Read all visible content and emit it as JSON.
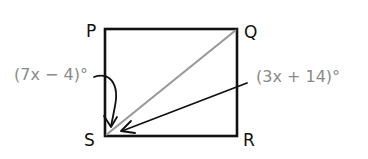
{
  "diagram": {
    "type": "geometry-square-with-diagonal",
    "vertices": {
      "P": {
        "label": "P",
        "x": 105,
        "y": 29
      },
      "Q": {
        "label": "Q",
        "x": 237,
        "y": 29
      },
      "R": {
        "label": "R",
        "x": 237,
        "y": 136
      },
      "S": {
        "label": "S",
        "x": 105,
        "y": 136
      }
    },
    "diagonal": {
      "from": "S",
      "to": "Q",
      "color": "#9a9a9a"
    },
    "angles": [
      {
        "name": "angle-PSQ",
        "label": "(7x − 4)°",
        "points_to": "S",
        "color": "#8a8a8a"
      },
      {
        "name": "angle-QSR",
        "label": "(3x + 14)°",
        "points_to": "S",
        "color": "#8a8a8a"
      }
    ],
    "colors": {
      "outline": "#111111",
      "diagonal": "#9a9a9a",
      "angle_text": "#8a8a8a",
      "background": "#ffffff"
    }
  }
}
